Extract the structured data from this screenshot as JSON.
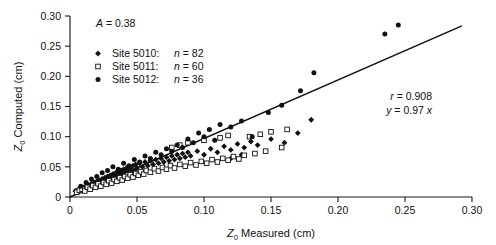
{
  "chart_data": {
    "type": "scatter",
    "title": "",
    "xlabel": "Z0 Measured (cm)",
    "ylabel": "Z0 Computed (cm)",
    "xlabel_parts": {
      "symbol": "Z",
      "subscript": "0",
      "rest": " Measured (cm)"
    },
    "ylabel_parts": {
      "symbol": "Z",
      "subscript": "0",
      "rest": " Computed (cm)"
    },
    "xlim": [
      0,
      0.3
    ],
    "ylim": [
      0,
      0.3
    ],
    "xticks": [
      0,
      0.05,
      0.1,
      0.15,
      0.2,
      0.25,
      0.3
    ],
    "xticklabels": [
      "0",
      "0.05",
      "0.10",
      "0.15",
      "0.20",
      "0.25",
      "0.30"
    ],
    "yticks": [
      0,
      0.05,
      0.1,
      0.15,
      0.2,
      0.25,
      0.3
    ],
    "yticklabels": [
      "0",
      "0.05",
      "0.10",
      "0.15",
      "0.20",
      "0.25",
      "0.30"
    ],
    "grid": false,
    "legend_position": "upper-left",
    "annotations": [
      {
        "name": "amplitude",
        "text": "A = 0.38",
        "italic_lead": "A",
        "rest": " = 0.38"
      },
      {
        "name": "correlation",
        "text": "r = 0.908",
        "italic_lead": "r",
        "rest": " = 0.908"
      },
      {
        "name": "fit-equation",
        "text": "y = 0.97 x",
        "italic_lead": "y",
        "rest": " = 0.97 ",
        "italic_tail": "x"
      }
    ],
    "fit_line": {
      "slope": 0.97,
      "intercept": 0.0,
      "x_start": 0.0,
      "x_end": 0.292
    },
    "series": [
      {
        "name": "Site 5010",
        "label": "Site 5010:",
        "count_label": "n = 82",
        "n": 82,
        "marker": "filled-diamond",
        "color": "#111111",
        "points": [
          [
            0.004,
            0.01
          ],
          [
            0.006,
            0.012
          ],
          [
            0.007,
            0.009
          ],
          [
            0.008,
            0.014
          ],
          [
            0.009,
            0.011
          ],
          [
            0.01,
            0.016
          ],
          [
            0.011,
            0.013
          ],
          [
            0.012,
            0.018
          ],
          [
            0.013,
            0.015
          ],
          [
            0.014,
            0.02
          ],
          [
            0.015,
            0.017
          ],
          [
            0.016,
            0.022
          ],
          [
            0.017,
            0.019
          ],
          [
            0.018,
            0.024
          ],
          [
            0.019,
            0.021
          ],
          [
            0.02,
            0.026
          ],
          [
            0.021,
            0.023
          ],
          [
            0.022,
            0.028
          ],
          [
            0.023,
            0.025
          ],
          [
            0.024,
            0.03
          ],
          [
            0.025,
            0.027
          ],
          [
            0.026,
            0.032
          ],
          [
            0.027,
            0.029
          ],
          [
            0.028,
            0.034
          ],
          [
            0.029,
            0.031
          ],
          [
            0.03,
            0.036
          ],
          [
            0.031,
            0.033
          ],
          [
            0.032,
            0.038
          ],
          [
            0.033,
            0.035
          ],
          [
            0.034,
            0.04
          ],
          [
            0.035,
            0.037
          ],
          [
            0.036,
            0.042
          ],
          [
            0.037,
            0.039
          ],
          [
            0.038,
            0.044
          ],
          [
            0.039,
            0.041
          ],
          [
            0.04,
            0.046
          ],
          [
            0.041,
            0.043
          ],
          [
            0.042,
            0.048
          ],
          [
            0.043,
            0.045
          ],
          [
            0.044,
            0.05
          ],
          [
            0.045,
            0.047
          ],
          [
            0.046,
            0.04
          ],
          [
            0.047,
            0.052
          ],
          [
            0.048,
            0.044
          ],
          [
            0.049,
            0.054
          ],
          [
            0.05,
            0.048
          ],
          [
            0.052,
            0.056
          ],
          [
            0.054,
            0.05
          ],
          [
            0.056,
            0.058
          ],
          [
            0.058,
            0.052
          ],
          [
            0.06,
            0.06
          ],
          [
            0.062,
            0.054
          ],
          [
            0.064,
            0.062
          ],
          [
            0.066,
            0.056
          ],
          [
            0.068,
            0.064
          ],
          [
            0.07,
            0.058
          ],
          [
            0.072,
            0.066
          ],
          [
            0.074,
            0.06
          ],
          [
            0.076,
            0.068
          ],
          [
            0.078,
            0.062
          ],
          [
            0.08,
            0.07
          ],
          [
            0.082,
            0.064
          ],
          [
            0.084,
            0.072
          ],
          [
            0.086,
            0.066
          ],
          [
            0.088,
            0.074
          ],
          [
            0.09,
            0.068
          ],
          [
            0.095,
            0.076
          ],
          [
            0.1,
            0.07
          ],
          [
            0.105,
            0.08
          ],
          [
            0.11,
            0.074
          ],
          [
            0.115,
            0.084
          ],
          [
            0.12,
            0.078
          ],
          [
            0.125,
            0.088
          ],
          [
            0.13,
            0.082
          ],
          [
            0.135,
            0.092
          ],
          [
            0.14,
            0.086
          ],
          [
            0.15,
            0.096
          ],
          [
            0.16,
            0.09
          ],
          [
            0.17,
            0.106
          ],
          [
            0.18,
            0.128
          ],
          [
            0.12,
            0.064
          ],
          [
            0.128,
            0.07
          ]
        ]
      },
      {
        "name": "Site 5011",
        "label": "Site 5011:",
        "count_label": "n = 60",
        "n": 60,
        "marker": "open-square",
        "color": "#111111",
        "points": [
          [
            0.005,
            0.008
          ],
          [
            0.007,
            0.011
          ],
          [
            0.009,
            0.013
          ],
          [
            0.011,
            0.01
          ],
          [
            0.013,
            0.016
          ],
          [
            0.015,
            0.013
          ],
          [
            0.017,
            0.019
          ],
          [
            0.019,
            0.016
          ],
          [
            0.021,
            0.022
          ],
          [
            0.023,
            0.018
          ],
          [
            0.025,
            0.024
          ],
          [
            0.027,
            0.021
          ],
          [
            0.029,
            0.027
          ],
          [
            0.031,
            0.023
          ],
          [
            0.033,
            0.029
          ],
          [
            0.035,
            0.026
          ],
          [
            0.037,
            0.032
          ],
          [
            0.039,
            0.028
          ],
          [
            0.041,
            0.034
          ],
          [
            0.043,
            0.031
          ],
          [
            0.045,
            0.037
          ],
          [
            0.047,
            0.033
          ],
          [
            0.049,
            0.039
          ],
          [
            0.051,
            0.036
          ],
          [
            0.053,
            0.042
          ],
          [
            0.055,
            0.038
          ],
          [
            0.057,
            0.044
          ],
          [
            0.06,
            0.041
          ],
          [
            0.063,
            0.047
          ],
          [
            0.066,
            0.043
          ],
          [
            0.069,
            0.049
          ],
          [
            0.072,
            0.046
          ],
          [
            0.075,
            0.052
          ],
          [
            0.078,
            0.048
          ],
          [
            0.082,
            0.054
          ],
          [
            0.086,
            0.051
          ],
          [
            0.09,
            0.057
          ],
          [
            0.094,
            0.053
          ],
          [
            0.098,
            0.059
          ],
          [
            0.102,
            0.056
          ],
          [
            0.106,
            0.062
          ],
          [
            0.11,
            0.058
          ],
          [
            0.114,
            0.064
          ],
          [
            0.118,
            0.061
          ],
          [
            0.122,
            0.067
          ],
          [
            0.126,
            0.063
          ],
          [
            0.13,
            0.069
          ],
          [
            0.134,
            0.1
          ],
          [
            0.138,
            0.072
          ],
          [
            0.142,
            0.104
          ],
          [
            0.146,
            0.076
          ],
          [
            0.15,
            0.108
          ],
          [
            0.112,
            0.098
          ],
          [
            0.118,
            0.102
          ],
          [
            0.1,
            0.094
          ],
          [
            0.158,
            0.082
          ],
          [
            0.162,
            0.112
          ],
          [
            0.088,
            0.09
          ],
          [
            0.082,
            0.086
          ],
          [
            0.076,
            0.082
          ]
        ]
      },
      {
        "name": "Site 5012",
        "label": "Site 5012:",
        "count_label": "n = 36",
        "n": 36,
        "marker": "filled-circle",
        "color": "#111111",
        "points": [
          [
            0.008,
            0.018
          ],
          [
            0.012,
            0.024
          ],
          [
            0.016,
            0.03
          ],
          [
            0.02,
            0.034
          ],
          [
            0.024,
            0.04
          ],
          [
            0.028,
            0.044
          ],
          [
            0.032,
            0.05
          ],
          [
            0.036,
            0.046
          ],
          [
            0.04,
            0.056
          ],
          [
            0.044,
            0.052
          ],
          [
            0.048,
            0.062
          ],
          [
            0.052,
            0.058
          ],
          [
            0.056,
            0.068
          ],
          [
            0.06,
            0.064
          ],
          [
            0.064,
            0.074
          ],
          [
            0.068,
            0.07
          ],
          [
            0.072,
            0.08
          ],
          [
            0.076,
            0.076
          ],
          [
            0.08,
            0.086
          ],
          [
            0.084,
            0.082
          ],
          [
            0.088,
            0.096
          ],
          [
            0.092,
            0.09
          ],
          [
            0.096,
            0.106
          ],
          [
            0.1,
            0.1
          ],
          [
            0.104,
            0.112
          ],
          [
            0.108,
            0.094
          ],
          [
            0.112,
            0.12
          ],
          [
            0.12,
            0.116
          ],
          [
            0.128,
            0.126
          ],
          [
            0.136,
            0.1
          ],
          [
            0.148,
            0.14
          ],
          [
            0.158,
            0.152
          ],
          [
            0.172,
            0.176
          ],
          [
            0.182,
            0.206
          ],
          [
            0.235,
            0.27
          ],
          [
            0.245,
            0.285
          ]
        ]
      }
    ]
  }
}
